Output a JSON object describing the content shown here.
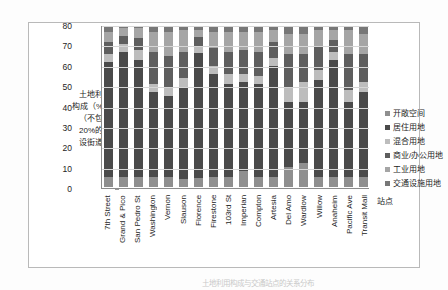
{
  "axis": {
    "y_title_lines": [
      "土地利用",
      "构成（%）",
      "（不包括",
      "20%的假",
      "设街道）"
    ],
    "x_title": "站点"
  },
  "caption": "土地利用构成与交通站点的关系分布",
  "chart_data": {
    "type": "bar",
    "title": "",
    "subtitle": "",
    "xlabel": "站点",
    "ylabel": "土地利用构成（%）（不包括20%的假设街道）",
    "ylim": [
      0,
      80
    ],
    "yticks": [
      0,
      10,
      20,
      30,
      40,
      50,
      60,
      70,
      80
    ],
    "grid": true,
    "stacked": true,
    "legend_position": "right",
    "categories": [
      "7th Street",
      "Grand & Pico",
      "San Pedro St",
      "Washington",
      "Vernon",
      "Slauson",
      "Florence",
      "Firestone",
      "103rd St",
      "Imperian",
      "Compton",
      "Artesia",
      "Del Amo",
      "Wardlow",
      "Willow",
      "Anaheim",
      "Pacific Ave",
      "Transit Mall"
    ],
    "series": [
      {
        "name": "开敞空间",
        "color": "#8f8f8f",
        "values": [
          5,
          5,
          5,
          5,
          5,
          4,
          5,
          5,
          5,
          8,
          5,
          5,
          10,
          12,
          5,
          5,
          5,
          5
        ]
      },
      {
        "name": "居住用地",
        "color": "#4a4a4a",
        "values": [
          57,
          62,
          58,
          42,
          40,
          45,
          70,
          51,
          46,
          44,
          46,
          55,
          32,
          30,
          48,
          58,
          37,
          42
        ]
      },
      {
        "name": "混合用地",
        "color": "#bdbdbd",
        "values": [
          4,
          4,
          5,
          4,
          4,
          5,
          4,
          4,
          5,
          4,
          4,
          4,
          7,
          10,
          5,
          4,
          6,
          5
        ]
      },
      {
        "name": "商业/办公用地",
        "color": "#5e5e5e",
        "values": [
          6,
          4,
          6,
          16,
          16,
          13,
          5,
          9,
          11,
          12,
          12,
          8,
          17,
          14,
          12,
          6,
          18,
          14
        ]
      },
      {
        "name": "工业用地",
        "color": "#a5a5a5",
        "values": [
          5,
          4,
          5,
          10,
          12,
          11,
          4,
          8,
          10,
          9,
          10,
          6,
          10,
          10,
          8,
          5,
          12,
          10
        ]
      },
      {
        "name": "交通设施用地",
        "color": "#777777",
        "values": [
          3,
          1,
          1,
          3,
          3,
          2,
          2,
          3,
          3,
          3,
          3,
          2,
          4,
          4,
          2,
          2,
          2,
          4
        ]
      }
    ]
  }
}
